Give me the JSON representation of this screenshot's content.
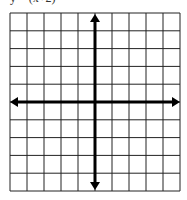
{
  "caption": "y = (x+2)",
  "grid": {
    "columns": 10,
    "rows": 10,
    "left": 10,
    "top": 13,
    "width": 170,
    "height": 178,
    "line_color": "#222222",
    "axis_color": "#000000",
    "background": "#ffffff"
  },
  "axes": {
    "x_axis_row_index": 5,
    "y_axis_col_index": 5,
    "arrows": [
      "left",
      "right",
      "up",
      "down"
    ]
  }
}
